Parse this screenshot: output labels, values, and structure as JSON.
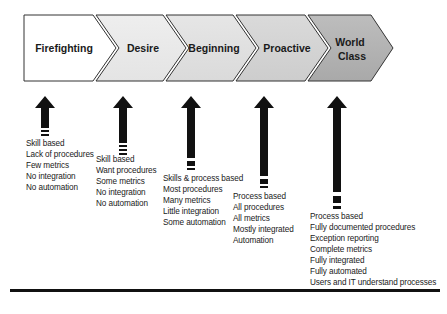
{
  "diagram": {
    "title": "",
    "stages": [
      {
        "label_lines": [
          "Firefighting"
        ],
        "fill": "#ffffff",
        "descriptions": [
          "Skill based",
          "Lack of procedures",
          "Few metrics",
          "No integration",
          "No automation"
        ]
      },
      {
        "label_lines": [
          "Desire"
        ],
        "fill": "#ececec",
        "descriptions": [
          "Skill based",
          "Want procedures",
          "Some metrics",
          "No integration",
          "No automation"
        ]
      },
      {
        "label_lines": [
          "Beginning"
        ],
        "fill": "#e2e2e2",
        "descriptions": [
          "Skills & process based",
          "Most procedures",
          "Many metrics",
          "Little integration",
          "Some automation"
        ]
      },
      {
        "label_lines": [
          "Proactive"
        ],
        "fill": "#d6d6d6",
        "descriptions": [
          "Process based",
          "All procedures",
          "All metrics",
          "Mostly integrated",
          "Automation"
        ]
      },
      {
        "label_lines": [
          "World",
          "Class"
        ],
        "fill": "#b8b8b8",
        "descriptions": [
          "Process based",
          "Fully documented procedures",
          "Exception reporting",
          "Complete metrics",
          "Fully integrated",
          "Fully automated",
          "Users and IT understand processes"
        ]
      }
    ],
    "colors": {
      "outline": "#333333",
      "arrow": "#111111",
      "text": "#1a1a1a"
    }
  }
}
